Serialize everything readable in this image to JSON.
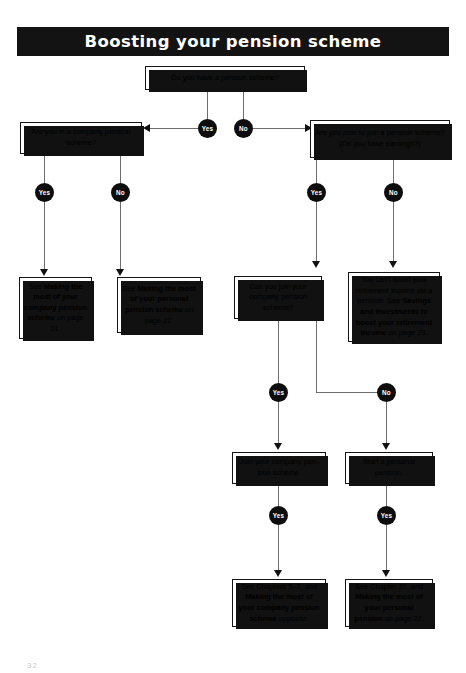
{
  "page": {
    "title": "Boosting your pension scheme",
    "page_number": "32"
  },
  "nodes": {
    "q_top": {
      "text": "Do you have a pension scheme?"
    },
    "q_company": {
      "text": "Are you in a company pension scheme?"
    },
    "q_able": {
      "text": "Are you able to join a pension scheme? (Do you have earnings?)"
    },
    "r_company": {
      "pre": "See ",
      "bold": "Making the most of your company pension scheme",
      "post": " on page 21."
    },
    "r_personal": {
      "pre": "See ",
      "bold": "Making the most of your personal pension scheme",
      "post": " on page 22."
    },
    "q_join": {
      "text": "Can you join your company pension scheme?"
    },
    "r_cant": {
      "pre": "You can't boost your retirement income via a pension. See ",
      "bold": "Savings and investments to boost your retirement income",
      "post": " on page 23."
    },
    "a_join": {
      "text": "Join your company pen-sion scheme."
    },
    "a_start": {
      "text": "Start a personal pension."
    },
    "r_chapters57": {
      "pre": "See Chapters 5–7, and ",
      "bold": "Making the most of your company pension scheme",
      "post": " opposite."
    },
    "r_chapter10": {
      "pre": "See Chapter 10, and ",
      "bold": "Making the most of your personal pension",
      "post": " on page 22."
    }
  },
  "labels": {
    "yes": "Yes",
    "no": "No"
  },
  "decisions": [
    {
      "id": "top-yes",
      "label": "Yes"
    },
    {
      "id": "top-no",
      "label": "No"
    },
    {
      "id": "company-yes",
      "label": "Yes"
    },
    {
      "id": "company-no",
      "label": "No"
    },
    {
      "id": "able-yes",
      "label": "Yes"
    },
    {
      "id": "able-no",
      "label": "No"
    },
    {
      "id": "join-yes",
      "label": "Yes"
    },
    {
      "id": "join-no",
      "label": "No"
    },
    {
      "id": "joinscheme-yes",
      "label": "Yes"
    },
    {
      "id": "startpen-yes",
      "label": "Yes"
    }
  ],
  "colors": {
    "banner_bg": "#131313",
    "banner_text": "#ffffff",
    "node_bg": "#0d0d0d",
    "node_text": "#ffffff",
    "line": "#6e6e6e",
    "box_border": "#151515",
    "box_shadow": "#111111"
  }
}
